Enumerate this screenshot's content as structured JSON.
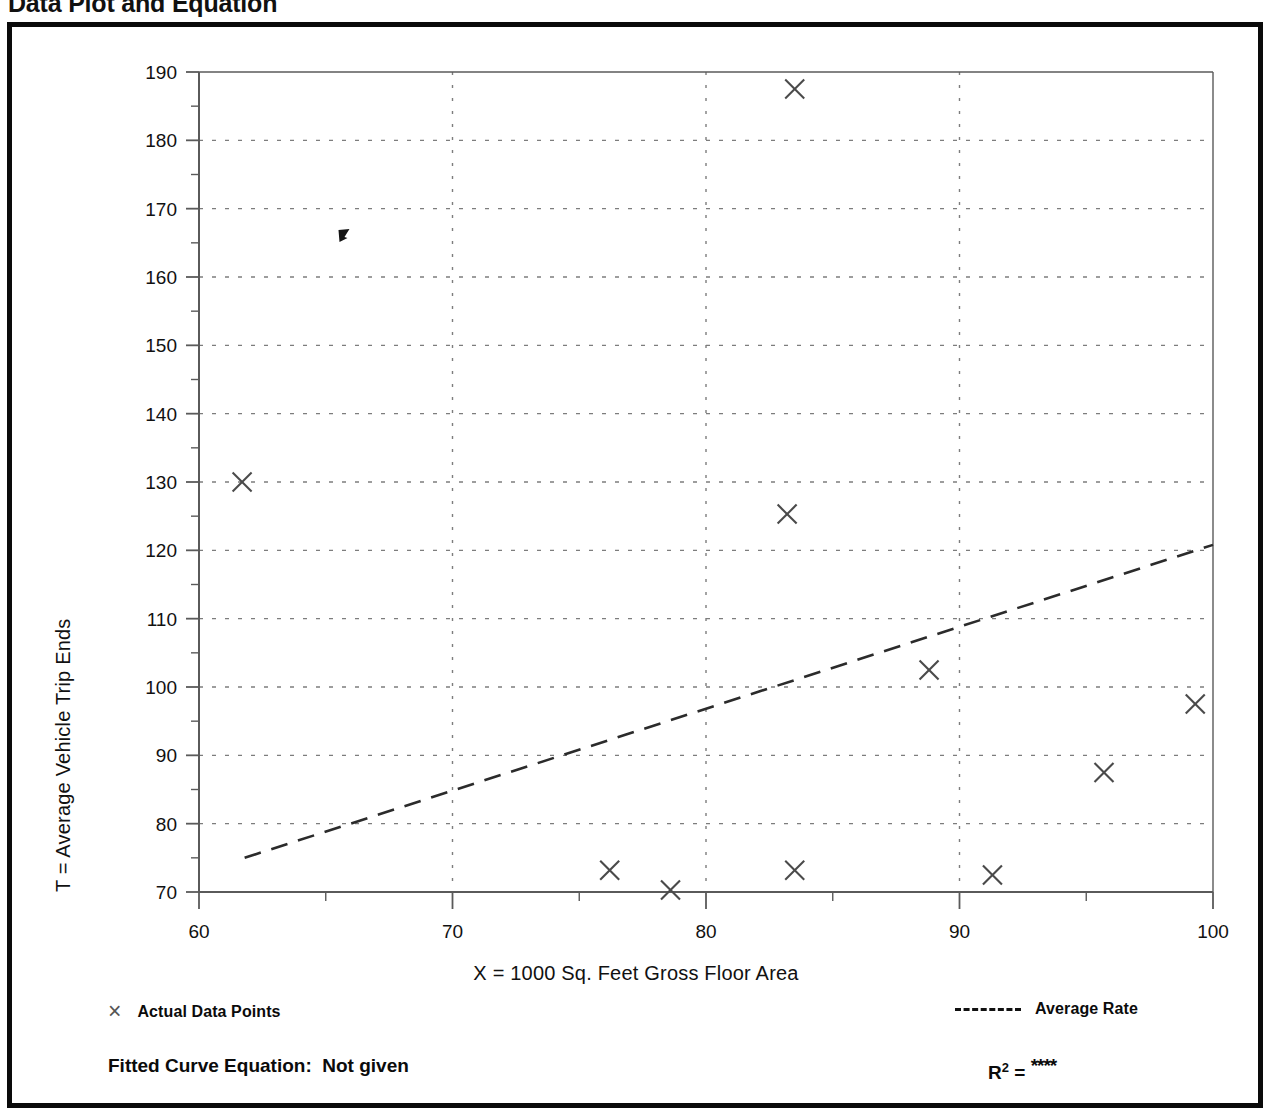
{
  "title": "Data Plot and Equation",
  "axes": {
    "y_title": "T = Average Vehicle Trip Ends",
    "x_title": "X = 1000 Sq. Feet Gross Floor Area"
  },
  "legend": {
    "points_marker": "×",
    "points_label": "Actual Data Points",
    "line_label": "Average Rate"
  },
  "equation": {
    "fitted_label": "Fitted Curve Equation:  Not given",
    "r_symbol": "R",
    "r_exponent": "2",
    "r_equals": " = ",
    "r_value": "****"
  },
  "colors": {
    "frame": "#0a0a0a",
    "axis": "#5a5a5a",
    "grid": "#7d7d7d",
    "marker": "#4a4a4a",
    "trend": "#2b2b2b",
    "text": "#111111",
    "background": "#ffffff"
  },
  "chart_data": {
    "type": "scatter",
    "title": "Data Plot and Equation",
    "xlabel": "X = 1000 Sq. Feet Gross Floor Area",
    "ylabel": "T = Average Vehicle Trip Ends",
    "xlim": [
      60,
      100
    ],
    "ylim": [
      70,
      190
    ],
    "xticks": [
      60,
      70,
      80,
      90,
      100
    ],
    "yticks": [
      70,
      80,
      90,
      100,
      110,
      120,
      130,
      140,
      150,
      160,
      170,
      180,
      190
    ],
    "x_minor_tick_step": 5,
    "y_minor_tick_step": 5,
    "grid": "dotted-major-both",
    "legend_position": "below-plot",
    "series": [
      {
        "name": "Actual Data Points",
        "type": "scatter",
        "marker": "x",
        "points": [
          {
            "x": 61.7,
            "y": 130.0
          },
          {
            "x": 65.7,
            "y": 166.0
          },
          {
            "x": 76.2,
            "y": 73.2
          },
          {
            "x": 78.6,
            "y": 70.3
          },
          {
            "x": 83.2,
            "y": 125.3
          },
          {
            "x": 83.5,
            "y": 187.5
          },
          {
            "x": 83.5,
            "y": 73.2
          },
          {
            "x": 88.8,
            "y": 102.5
          },
          {
            "x": 91.3,
            "y": 72.5
          },
          {
            "x": 95.7,
            "y": 87.5
          },
          {
            "x": 99.3,
            "y": 97.5
          }
        ]
      },
      {
        "name": "Average Rate",
        "type": "line",
        "style": "dashed",
        "endpoints": [
          {
            "x": 61.8,
            "y": 75.0
          },
          {
            "x": 100.0,
            "y": 120.8
          }
        ]
      }
    ],
    "annotations": {
      "fitted_curve_equation": "Not given",
      "r_squared": "****"
    }
  }
}
